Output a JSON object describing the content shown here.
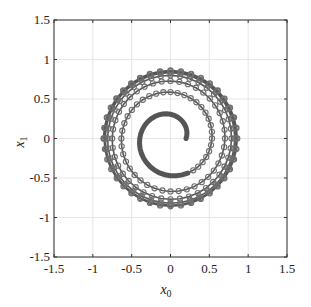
{
  "chart_data": {
    "type": "line",
    "title": "",
    "xlabel": "x_0",
    "ylabel": "x_1",
    "xlabel_main": "x",
    "xlabel_sub": "0",
    "ylabel_main": "x",
    "ylabel_sub": "1",
    "xlim": [
      -1.5,
      1.5
    ],
    "ylim": [
      -1.5,
      1.5
    ],
    "xticks": [
      -1.5,
      -1,
      -0.5,
      0,
      0.5,
      1,
      1.5
    ],
    "yticks": [
      -1.5,
      -1,
      -0.5,
      0,
      0.5,
      1,
      1.5
    ],
    "xtick_labels": [
      "-1.5",
      "-1",
      "-0.5",
      "0",
      "0.5",
      "1",
      "1.5"
    ],
    "ytick_labels": [
      "-1.5",
      "-1",
      "-0.5",
      "0",
      "0.5",
      "1",
      "1.5"
    ],
    "grid": true,
    "legend": null,
    "series": [
      {
        "name": "trajectory",
        "description": "Counter-clockwise spiral trajectory starting near (0.2, 0) and converging outward to a limit cycle of radius ~0.87",
        "marker": "open-circle",
        "line_color": "#555555",
        "marker_color": "#6e6e6e",
        "start_point": [
          0.2,
          0.0
        ],
        "start_radius": 0.2,
        "limit_radius": 0.87,
        "turns": 6.5,
        "points_per_turn": 40,
        "markers_start_after_turns": 0.85,
        "sample_points": [
          {
            "x": 0.2,
            "y": 0.0
          },
          {
            "x": 0.0,
            "y": 0.3
          },
          {
            "x": -0.37,
            "y": 0.0
          },
          {
            "x": 0.0,
            "y": -0.45
          },
          {
            "x": 0.52,
            "y": 0.0
          },
          {
            "x": 0.0,
            "y": 0.6
          },
          {
            "x": -0.66,
            "y": 0.0
          },
          {
            "x": 0.0,
            "y": -0.71
          },
          {
            "x": 0.75,
            "y": 0.0
          },
          {
            "x": 0.0,
            "y": 0.79
          },
          {
            "x": -0.82,
            "y": 0.0
          },
          {
            "x": 0.0,
            "y": -0.84
          },
          {
            "x": 0.86,
            "y": 0.0
          },
          {
            "x": 0.0,
            "y": 0.87
          },
          {
            "x": -0.88,
            "y": 0.0
          }
        ]
      }
    ]
  },
  "colors": {
    "axis": "#333333",
    "grid": "#e6e6e6",
    "line": "#555555",
    "marker": "#6e6e6e"
  }
}
